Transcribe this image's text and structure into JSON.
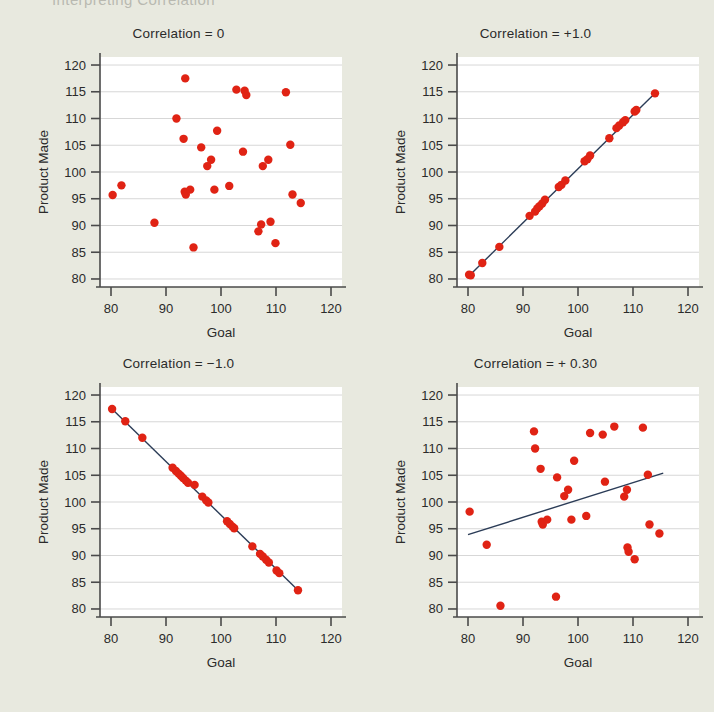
{
  "running_header": "Interpreting Correlation",
  "colors": {
    "page_background": "#e8e9df",
    "plot_background": "#ffffff",
    "point": "#e02314",
    "trend_line": "#2b3c57",
    "axis": "#4a4a4a",
    "gridline": "#d7d7d7",
    "text": "#2b2b2b"
  },
  "shared": {
    "xlabel": "Goal",
    "ylabel": "Product Made",
    "xticks": [
      80,
      90,
      100,
      110,
      120
    ],
    "yticks": [
      80,
      85,
      90,
      95,
      100,
      105,
      110,
      115,
      120
    ],
    "xlim": [
      78,
      122
    ],
    "ylim": [
      78.5,
      121.5
    ],
    "grid": true,
    "legend": "none"
  },
  "chart_data": [
    {
      "type": "scatter",
      "title": "Correlation = 0",
      "xlabel": "Goal",
      "ylabel": "Product Made",
      "xlim": [
        78,
        122
      ],
      "ylim": [
        78.5,
        121.5
      ],
      "xticks": [
        80,
        90,
        100,
        110,
        120
      ],
      "yticks": [
        80,
        85,
        90,
        95,
        100,
        105,
        110,
        115,
        120
      ],
      "grid": true,
      "correlation": 0,
      "trend_line": null,
      "points": [
        [
          80.3,
          95.7
        ],
        [
          81.9,
          97.5
        ],
        [
          87.9,
          90.5
        ],
        [
          91.9,
          110.0
        ],
        [
          93.2,
          106.2
        ],
        [
          93.5,
          117.5
        ],
        [
          93.4,
          96.3
        ],
        [
          93.6,
          95.8
        ],
        [
          94.4,
          96.7
        ],
        [
          95.0,
          85.9
        ],
        [
          96.4,
          104.6
        ],
        [
          97.5,
          101.1
        ],
        [
          98.2,
          102.3
        ],
        [
          98.8,
          96.7
        ],
        [
          99.3,
          107.7
        ],
        [
          101.5,
          97.4
        ],
        [
          102.8,
          115.4
        ],
        [
          104.3,
          115.2
        ],
        [
          104.6,
          114.4
        ],
        [
          104.0,
          103.8
        ],
        [
          106.8,
          88.9
        ],
        [
          107.3,
          90.2
        ],
        [
          107.6,
          101.1
        ],
        [
          108.6,
          102.3
        ],
        [
          109.0,
          90.7
        ],
        [
          109.9,
          86.7
        ],
        [
          111.8,
          114.9
        ],
        [
          112.6,
          105.1
        ],
        [
          113.0,
          95.8
        ],
        [
          114.5,
          94.2
        ]
      ]
    },
    {
      "type": "scatter",
      "title": "Correlation = +1.0",
      "xlabel": "Goal",
      "ylabel": "Product Made",
      "xlim": [
        78,
        122
      ],
      "ylim": [
        78.5,
        121.5
      ],
      "xticks": [
        80,
        90,
        100,
        110,
        120
      ],
      "yticks": [
        80,
        85,
        90,
        95,
        100,
        105,
        110,
        115,
        120
      ],
      "grid": true,
      "correlation": 1.0,
      "trend_line": {
        "x1": 80.3,
        "y1": 80.7,
        "x2": 114.0,
        "y2": 114.7
      },
      "points": [
        [
          80.2,
          80.8
        ],
        [
          80.5,
          80.7
        ],
        [
          82.6,
          83.0
        ],
        [
          85.7,
          86.0
        ],
        [
          91.2,
          91.8
        ],
        [
          92.2,
          92.6
        ],
        [
          92.6,
          93.2
        ],
        [
          93.0,
          93.6
        ],
        [
          93.5,
          94.1
        ],
        [
          94.0,
          94.8
        ],
        [
          96.5,
          97.2
        ],
        [
          97.0,
          97.6
        ],
        [
          97.7,
          98.4
        ],
        [
          101.2,
          102.0
        ],
        [
          101.7,
          102.4
        ],
        [
          102.2,
          103.1
        ],
        [
          105.7,
          106.3
        ],
        [
          107.0,
          108.2
        ],
        [
          107.5,
          108.7
        ],
        [
          108.2,
          109.3
        ],
        [
          108.6,
          109.7
        ],
        [
          110.3,
          111.3
        ],
        [
          110.6,
          111.6
        ],
        [
          114.0,
          114.7
        ]
      ]
    },
    {
      "type": "scatter",
      "title": "Correlation = −1.0",
      "xlabel": "Goal",
      "ylabel": "Product Made",
      "xlim": [
        78,
        122
      ],
      "ylim": [
        78.5,
        121.5
      ],
      "xticks": [
        80,
        90,
        100,
        110,
        120
      ],
      "yticks": [
        80,
        85,
        90,
        95,
        100,
        105,
        110,
        115,
        120
      ],
      "grid": true,
      "correlation": -1.0,
      "trend_line": {
        "x1": 80.1,
        "y1": 117.5,
        "x2": 114.0,
        "y2": 83.5
      },
      "points": [
        [
          80.2,
          117.4
        ],
        [
          82.6,
          115.1
        ],
        [
          85.7,
          112.0
        ],
        [
          91.2,
          106.4
        ],
        [
          91.8,
          105.8
        ],
        [
          92.3,
          105.3
        ],
        [
          92.7,
          104.9
        ],
        [
          93.1,
          104.5
        ],
        [
          93.6,
          104.0
        ],
        [
          94.0,
          103.6
        ],
        [
          95.2,
          103.2
        ],
        [
          96.6,
          101.0
        ],
        [
          97.3,
          100.3
        ],
        [
          97.7,
          99.9
        ],
        [
          101.1,
          96.4
        ],
        [
          101.6,
          95.9
        ],
        [
          102.1,
          95.4
        ],
        [
          102.4,
          95.1
        ],
        [
          105.7,
          91.7
        ],
        [
          107.1,
          90.3
        ],
        [
          107.6,
          89.8
        ],
        [
          108.2,
          89.2
        ],
        [
          108.7,
          88.7
        ],
        [
          110.1,
          87.2
        ],
        [
          110.6,
          86.7
        ],
        [
          114.0,
          83.5
        ]
      ]
    },
    {
      "type": "scatter",
      "title": "Correlation = + 0.30",
      "xlabel": "Goal",
      "ylabel": "Product Made",
      "xlim": [
        78,
        122
      ],
      "ylim": [
        78.5,
        121.5
      ],
      "xticks": [
        80,
        90,
        100,
        110,
        120
      ],
      "yticks": [
        80,
        85,
        90,
        95,
        100,
        105,
        110,
        115,
        120
      ],
      "grid": true,
      "correlation": 0.3,
      "trend_line": {
        "x1": 80.0,
        "y1": 93.9,
        "x2": 115.5,
        "y2": 105.4
      },
      "points": [
        [
          80.3,
          98.2
        ],
        [
          83.4,
          92.0
        ],
        [
          85.9,
          80.6
        ],
        [
          92.0,
          113.2
        ],
        [
          92.2,
          110.0
        ],
        [
          93.2,
          106.2
        ],
        [
          93.4,
          96.3
        ],
        [
          93.6,
          95.8
        ],
        [
          94.4,
          96.7
        ],
        [
          96.0,
          82.3
        ],
        [
          96.2,
          104.6
        ],
        [
          97.5,
          101.1
        ],
        [
          98.2,
          102.3
        ],
        [
          98.8,
          96.7
        ],
        [
          99.3,
          107.7
        ],
        [
          101.5,
          97.4
        ],
        [
          102.2,
          112.9
        ],
        [
          104.5,
          112.6
        ],
        [
          104.9,
          103.8
        ],
        [
          106.6,
          114.1
        ],
        [
          108.4,
          101.0
        ],
        [
          108.9,
          102.3
        ],
        [
          109.0,
          91.5
        ],
        [
          109.2,
          90.7
        ],
        [
          110.3,
          89.3
        ],
        [
          111.8,
          113.9
        ],
        [
          112.7,
          105.1
        ],
        [
          113.0,
          95.8
        ],
        [
          114.8,
          94.1
        ]
      ]
    }
  ]
}
